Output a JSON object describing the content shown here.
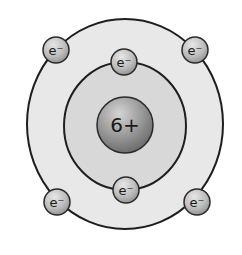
{
  "diagram": {
    "nucleus": {
      "label": "6+",
      "cx": 125,
      "cy": 125,
      "r": 28
    },
    "shells": [
      {
        "name": "inner",
        "cx": 125,
        "cy": 126,
        "rx": 61,
        "ry": 64,
        "fill": "#d6d6d6"
      },
      {
        "name": "outer",
        "cx": 125,
        "cy": 124,
        "rx": 98,
        "ry": 105,
        "fill": "#e8e8e8"
      }
    ],
    "electrons": [
      {
        "label": "e⁻",
        "shell": "inner",
        "cx": 124,
        "cy": 62
      },
      {
        "label": "e⁻",
        "shell": "inner",
        "cx": 126,
        "cy": 190
      },
      {
        "label": "e⁻",
        "shell": "outer",
        "cx": 56,
        "cy": 50
      },
      {
        "label": "e⁻",
        "shell": "outer",
        "cx": 195,
        "cy": 50
      },
      {
        "label": "e⁻",
        "shell": "outer",
        "cx": 57,
        "cy": 202
      },
      {
        "label": "e⁻",
        "shell": "outer",
        "cx": 197,
        "cy": 202
      }
    ],
    "colors": {
      "stroke": "#1e1e1e",
      "nucleus_light": "#c8c8c8",
      "nucleus_dark": "#7a7a7a",
      "electron_light": "#dcdcdc",
      "electron_dark": "#9a9a9a"
    }
  }
}
